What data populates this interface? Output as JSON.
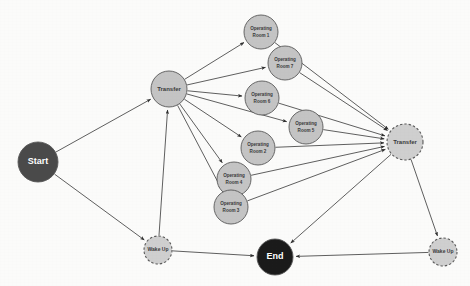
{
  "diagram": {
    "type": "directed-graph",
    "width": 470,
    "height": 286,
    "background_color": "#fbfbfa",
    "edge_color": "#4d4d4d"
  },
  "styles": {
    "start_fill": "#4a4a4a",
    "start_text": "#ffffff",
    "end_fill": "#1a1a1a",
    "end_text": "#ffffff",
    "activity_fill": "#c4c4c4",
    "activity_text": "#3a3a3a",
    "dashed_fill": "#cfcfcf",
    "dashed_text": "#3a3a3a",
    "node_stroke": "#595959"
  },
  "nodes": [
    {
      "id": "start",
      "label": "Start",
      "kind": "start",
      "x": 38,
      "y": 162,
      "r": 20,
      "fill": "#4a4a4a",
      "text_color": "#ffffff",
      "border": "solid",
      "font_size": 9,
      "lines": [
        "Start"
      ]
    },
    {
      "id": "transfer_in",
      "label": "Transfer",
      "kind": "activity",
      "x": 169,
      "y": 89,
      "r": 18,
      "fill": "#c4c4c4",
      "text_color": "#3a3a3a",
      "border": "solid",
      "font_size": 6,
      "lines": [
        "Transfer"
      ]
    },
    {
      "id": "or1",
      "label": "Operating Room 1",
      "kind": "activity",
      "x": 261,
      "y": 32,
      "r": 17,
      "fill": "#c4c4c4",
      "text_color": "#3a3a3a",
      "border": "solid",
      "font_size": 4.6,
      "lines": [
        "Operating",
        "Room 1"
      ]
    },
    {
      "id": "or7",
      "label": "Operating Room 7",
      "kind": "activity",
      "x": 285,
      "y": 63,
      "r": 17,
      "fill": "#c4c4c4",
      "text_color": "#3a3a3a",
      "border": "solid",
      "font_size": 4.6,
      "lines": [
        "Operating",
        "Room 7"
      ]
    },
    {
      "id": "or6",
      "label": "Operating Room 6",
      "kind": "activity",
      "x": 262,
      "y": 98,
      "r": 17,
      "fill": "#c4c4c4",
      "text_color": "#3a3a3a",
      "border": "solid",
      "font_size": 4.6,
      "lines": [
        "Operating",
        "Room 6"
      ]
    },
    {
      "id": "or5",
      "label": "Operating Room 5",
      "kind": "activity",
      "x": 306,
      "y": 127,
      "r": 17,
      "fill": "#c4c4c4",
      "text_color": "#3a3a3a",
      "border": "solid",
      "font_size": 4.6,
      "lines": [
        "Operating",
        "Room 5"
      ]
    },
    {
      "id": "or2",
      "label": "Operating Room 2",
      "kind": "activity",
      "x": 258,
      "y": 148,
      "r": 17,
      "fill": "#c4c4c4",
      "text_color": "#3a3a3a",
      "border": "solid",
      "font_size": 4.6,
      "lines": [
        "Operating",
        "Room 2"
      ]
    },
    {
      "id": "or4",
      "label": "Operating Room 4",
      "kind": "activity",
      "x": 234,
      "y": 179,
      "r": 17,
      "fill": "#c4c4c4",
      "text_color": "#3a3a3a",
      "border": "solid",
      "font_size": 4.6,
      "lines": [
        "Operating",
        "Room 4"
      ]
    },
    {
      "id": "or3",
      "label": "Operating Room 3",
      "kind": "activity",
      "x": 231,
      "y": 207,
      "r": 17,
      "fill": "#c4c4c4",
      "text_color": "#3a3a3a",
      "border": "solid",
      "font_size": 4.6,
      "lines": [
        "Operating",
        "Room 3"
      ]
    },
    {
      "id": "transfer_out",
      "label": "Transfer",
      "kind": "activity-dashed",
      "x": 405,
      "y": 142,
      "r": 18,
      "fill": "#cfcfcf",
      "text_color": "#3a3a3a",
      "border": "dashed",
      "font_size": 6,
      "lines": [
        "Transfer"
      ]
    },
    {
      "id": "wakeup_left",
      "label": "Wake Up",
      "kind": "activity-dashed",
      "x": 158,
      "y": 250,
      "r": 14,
      "fill": "#cfcfcf",
      "text_color": "#3a3a3a",
      "border": "dashed",
      "font_size": 5,
      "lines": [
        "Wake Up"
      ]
    },
    {
      "id": "wakeup_right",
      "label": "Wake Up",
      "kind": "activity-dashed",
      "x": 443,
      "y": 252,
      "r": 14,
      "fill": "#cfcfcf",
      "text_color": "#3a3a3a",
      "border": "dashed",
      "font_size": 5,
      "lines": [
        "Wake Up"
      ]
    },
    {
      "id": "end",
      "label": "End",
      "kind": "end",
      "x": 275,
      "y": 257,
      "r": 18,
      "fill": "#1a1a1a",
      "text_color": "#ffffff",
      "border": "solid",
      "font_size": 9,
      "lines": [
        "End"
      ]
    }
  ],
  "edges": [
    {
      "from": "start",
      "to": "transfer_in"
    },
    {
      "from": "start",
      "to": "wakeup_left"
    },
    {
      "from": "wakeup_left",
      "to": "transfer_in"
    },
    {
      "from": "wakeup_left",
      "to": "end"
    },
    {
      "from": "transfer_in",
      "to": "or1"
    },
    {
      "from": "transfer_in",
      "to": "or7"
    },
    {
      "from": "transfer_in",
      "to": "or6"
    },
    {
      "from": "transfer_in",
      "to": "or5"
    },
    {
      "from": "transfer_in",
      "to": "or2"
    },
    {
      "from": "transfer_in",
      "to": "or4"
    },
    {
      "from": "transfer_in",
      "to": "or3"
    },
    {
      "from": "or1",
      "to": "transfer_out"
    },
    {
      "from": "or7",
      "to": "transfer_out"
    },
    {
      "from": "or6",
      "to": "transfer_out"
    },
    {
      "from": "or5",
      "to": "transfer_out"
    },
    {
      "from": "or2",
      "to": "transfer_out"
    },
    {
      "from": "or4",
      "to": "transfer_out"
    },
    {
      "from": "or3",
      "to": "transfer_out"
    },
    {
      "from": "transfer_out",
      "to": "end"
    },
    {
      "from": "transfer_out",
      "to": "wakeup_right"
    },
    {
      "from": "wakeup_right",
      "to": "end"
    }
  ]
}
